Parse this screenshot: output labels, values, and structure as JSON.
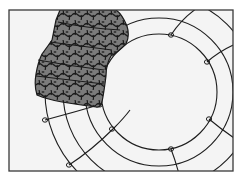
{
  "illustration": {
    "subject": "wire wreath frame with moss being applied",
    "colors": {
      "background": "#ffffff",
      "panel": "#f4f4f4",
      "frame_border": "#3a3a3a",
      "wire": "#1e1e1e",
      "moss_fill": "#7b7b7b",
      "moss_outline": "#1a1a1a"
    },
    "frame": {
      "x": 9,
      "y": 10,
      "width": 224,
      "height": 161
    },
    "wreath": {
      "center": [
        159,
        92
      ],
      "ring_radii": [
        58,
        74,
        96,
        114
      ]
    },
    "loops": [
      [
        171,
        35
      ],
      [
        207,
        62
      ],
      [
        209,
        119
      ],
      [
        171,
        149
      ],
      [
        112,
        129
      ],
      [
        45,
        120
      ],
      [
        69,
        165
      ],
      [
        100,
        104
      ]
    ]
  }
}
